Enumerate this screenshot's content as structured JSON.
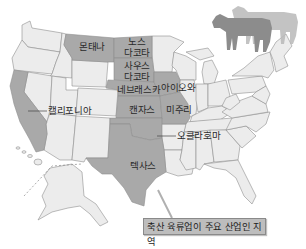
{
  "map": {
    "region": "United States",
    "colors": {
      "highlight": "#a9a9a9",
      "other_state": "#ececec",
      "border": "#8f8f8f",
      "cow_dark": "#8c8c8c",
      "cow_light": "#b8b8b8",
      "legend_bg": "#bdbdbd"
    },
    "highlighted_states": [
      {
        "id": "montana",
        "label": "몬태나"
      },
      {
        "id": "north-dakota",
        "label_line1": "노스",
        "label_line2": "다코타"
      },
      {
        "id": "south-dakota",
        "label_line1": "사우스",
        "label_line2": "다코타"
      },
      {
        "id": "nebraska",
        "label": "네브래스카"
      },
      {
        "id": "iowa",
        "label": "아이오와"
      },
      {
        "id": "kansas",
        "label": "캔자스"
      },
      {
        "id": "missouri",
        "label": "미주리"
      },
      {
        "id": "oklahoma",
        "label": "오클라호마"
      },
      {
        "id": "texas",
        "label": "텍사스"
      },
      {
        "id": "california",
        "label": "캘리포니아"
      }
    ],
    "legend": {
      "label": "축산 육류업이 주요 산업인 지역"
    },
    "decoration": "cattle-silhouettes"
  }
}
